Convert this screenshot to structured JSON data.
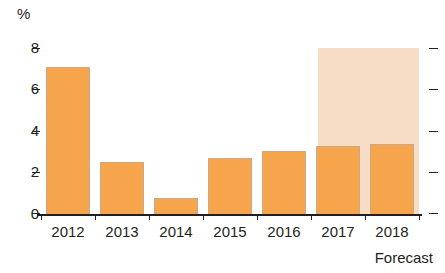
{
  "chart_data": {
    "type": "bar",
    "title": "",
    "subtitle": "",
    "xlabel": "",
    "ylabel": "%",
    "unit_label": "%",
    "categories": [
      "2012",
      "2013",
      "2014",
      "2015",
      "2016",
      "2017",
      "2018"
    ],
    "values": [
      7.1,
      2.55,
      0.8,
      2.75,
      3.05,
      3.3,
      3.4
    ],
    "series": [
      {
        "name": "Value",
        "values": [
          7.1,
          2.55,
          0.8,
          2.75,
          3.05,
          3.3,
          3.4
        ]
      }
    ],
    "ylim": [
      0,
      8
    ],
    "y_ticks": [
      0,
      2,
      4,
      6,
      8
    ],
    "y_tick_labels": [
      "0",
      "2",
      "4",
      "6",
      "8"
    ],
    "grid": false,
    "legend": false,
    "legend_position": "none",
    "annotations": [
      {
        "text": "Forecast",
        "covers_categories": [
          "2017",
          "2018"
        ],
        "position": "below-right"
      }
    ],
    "forecast_region": {
      "label": "Forecast",
      "start_category": "2017",
      "end_category": "2018",
      "shaded": true,
      "shade_top_value": 8
    },
    "colors": {
      "bar_fill": "#f6a54c",
      "bar_border": "#c9a88c",
      "forecast_shade": "#f7dcc6",
      "axis": "#231f20",
      "text": "#231f20",
      "background": "#ffffff"
    }
  },
  "axis": {
    "unit": "%",
    "right_ticks": [
      "8",
      "6",
      "4",
      "2",
      "0"
    ]
  },
  "footer": {
    "forecast_note": "Forecast"
  }
}
